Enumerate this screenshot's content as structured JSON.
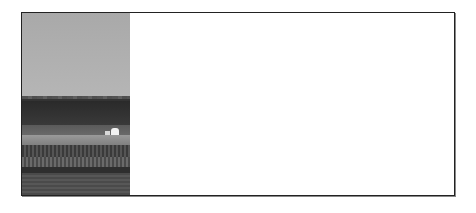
{
  "page": {
    "frame_border_color": "#222222",
    "background_color": "#ffffff"
  },
  "photo": {
    "description": "Grayscale rural landscape: overcast sky, dark treeline, white farm buildings, crop rows and field",
    "colors": {
      "sky": "#b0b0b0",
      "trees": "#333333",
      "field": "#555555",
      "buildings": "#f2f2f2"
    }
  },
  "blank_panel": {
    "text": ""
  }
}
